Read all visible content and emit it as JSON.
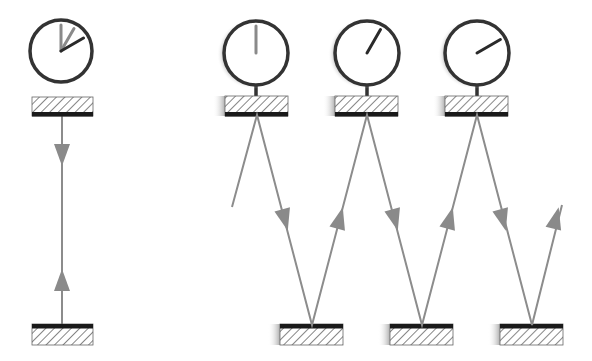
{
  "diagram": {
    "colors": {
      "background": "#ffffff",
      "clock_outline": "#333333",
      "hand_dark": "#2a2a2a",
      "hand_light": "#8a8a8a",
      "light_ray": "#8c8c8c",
      "arrow_fill": "#8a8a8a",
      "mirror_bar": "#1a1a1a",
      "hatch": "#444444",
      "shadow": "#bbbbbb"
    },
    "stationary_clock": {
      "clock": {
        "cx": 61,
        "cy": 51,
        "r": 31,
        "hands": [
          {
            "angle": 0,
            "shade": "light"
          },
          {
            "angle": 30,
            "shade": "light"
          },
          {
            "angle": 60,
            "shade": "dark"
          }
        ]
      },
      "top_mirror": {
        "x": 32,
        "y": 97,
        "w": 61,
        "h": 19,
        "bar": "bottom"
      },
      "bottom_mirror": {
        "x": 32,
        "y": 324,
        "w": 61,
        "h": 21,
        "bar": "top"
      },
      "ray": {
        "x": 62,
        "y1": 116,
        "y2": 324
      },
      "arrows": [
        {
          "x": 62,
          "y": 155,
          "dir": "down"
        },
        {
          "x": 62,
          "y": 280,
          "dir": "up"
        }
      ]
    },
    "moving_clocks": [
      {
        "cx": 256,
        "cy": 53,
        "r": 32,
        "hand_angle": 0,
        "hand_shade": "light",
        "mirror_x": 225
      },
      {
        "cx": 367,
        "cy": 53,
        "r": 32,
        "hand_angle": 30,
        "hand_shade": "dark",
        "mirror_x": 335
      },
      {
        "cx": 477,
        "cy": 53,
        "r": 32,
        "hand_angle": 60,
        "hand_shade": "dark",
        "mirror_x": 445
      }
    ],
    "moving_bottom_mirrors": [
      {
        "x": 280
      },
      {
        "x": 390
      },
      {
        "x": 500
      }
    ],
    "light_path": [
      [
        232,
        207
      ],
      [
        257,
        115
      ],
      [
        312,
        325
      ],
      [
        367,
        115
      ],
      [
        422,
        325
      ],
      [
        477,
        115
      ],
      [
        532,
        325
      ],
      [
        562,
        205
      ]
    ],
    "path_arrows": [
      {
        "x": 285,
        "y": 220,
        "from": [
          257,
          115
        ],
        "to": [
          312,
          325
        ]
      },
      {
        "x": 340,
        "y": 218,
        "from": [
          312,
          325
        ],
        "to": [
          367,
          115
        ]
      },
      {
        "x": 395,
        "y": 220,
        "from": [
          367,
          115
        ],
        "to": [
          422,
          325
        ]
      },
      {
        "x": 450,
        "y": 218,
        "from": [
          422,
          325
        ],
        "to": [
          477,
          115
        ]
      },
      {
        "x": 503,
        "y": 220,
        "from": [
          477,
          115
        ],
        "to": [
          532,
          325
        ]
      },
      {
        "x": 556,
        "y": 218,
        "from": [
          532,
          325
        ],
        "to": [
          562,
          205
        ]
      }
    ]
  }
}
